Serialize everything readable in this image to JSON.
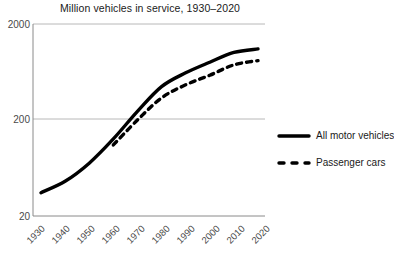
{
  "chart_data": {
    "type": "line",
    "title": "Million vehicles in service, 1930–2020",
    "xlabel": "",
    "ylabel": "",
    "yscale": "log",
    "ylim": [
      20,
      2000
    ],
    "ytick_labels": [
      "2000",
      "200",
      "20"
    ],
    "ytick_values": [
      2000,
      200,
      20
    ],
    "xlim": [
      1930,
      2020
    ],
    "x": [
      1930,
      1940,
      1950,
      1960,
      1970,
      1980,
      1990,
      2000,
      2010,
      2020
    ],
    "xtick_labels": [
      "1930",
      "1940",
      "1950",
      "1960",
      "1970",
      "1980",
      "1990",
      "2000",
      "2010",
      "2020"
    ],
    "grid": "horizontal",
    "legend_position": "right",
    "series": [
      {
        "name": "All motor vehicles",
        "style": "solid",
        "color": "#000000",
        "values": [
          35,
          46,
          71,
          127,
          246,
          445,
          620,
          800,
          1010,
          1100
        ]
      },
      {
        "name": "Passenger cars",
        "style": "dashed",
        "color": "#000000",
        "values": [
          null,
          null,
          null,
          110,
          200,
          340,
          465,
          585,
          750,
          830
        ]
      }
    ]
  },
  "legend": {
    "items": [
      {
        "label": "All motor vehicles",
        "style": "solid"
      },
      {
        "label": "Passenger cars",
        "style": "dashed"
      }
    ]
  }
}
